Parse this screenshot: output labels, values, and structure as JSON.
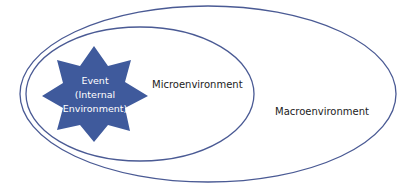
{
  "diagram": {
    "colors": {
      "outline": "#4a5a94",
      "star_fill": "#3f5a9c",
      "star_text": "#ffffff",
      "label_text": "#222222"
    },
    "shapes": {
      "macroenvironment": {
        "label": "Macroenvironment",
        "shape": "ellipse"
      },
      "microenvironment": {
        "label": "Microenvironment",
        "shape": "ellipse"
      },
      "event": {
        "shape": "8-point-star",
        "lines": [
          "Event",
          "(Internal",
          "Environment)"
        ]
      }
    }
  }
}
